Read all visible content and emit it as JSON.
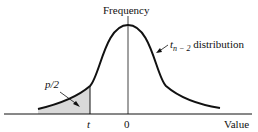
{
  "diagram": {
    "type": "t-distribution-curve",
    "labels": {
      "y_axis": "Frequency",
      "x_axis": "Value",
      "curve_name_main": "t",
      "curve_name_sub": "n − 2",
      "curve_name_suffix": " distribution",
      "tail_area": "p/2",
      "t_tick": "t",
      "zero_tick": "0"
    },
    "colors": {
      "curve": "#111111",
      "shade": "#d9d9d9",
      "axis": "#111111"
    }
  }
}
